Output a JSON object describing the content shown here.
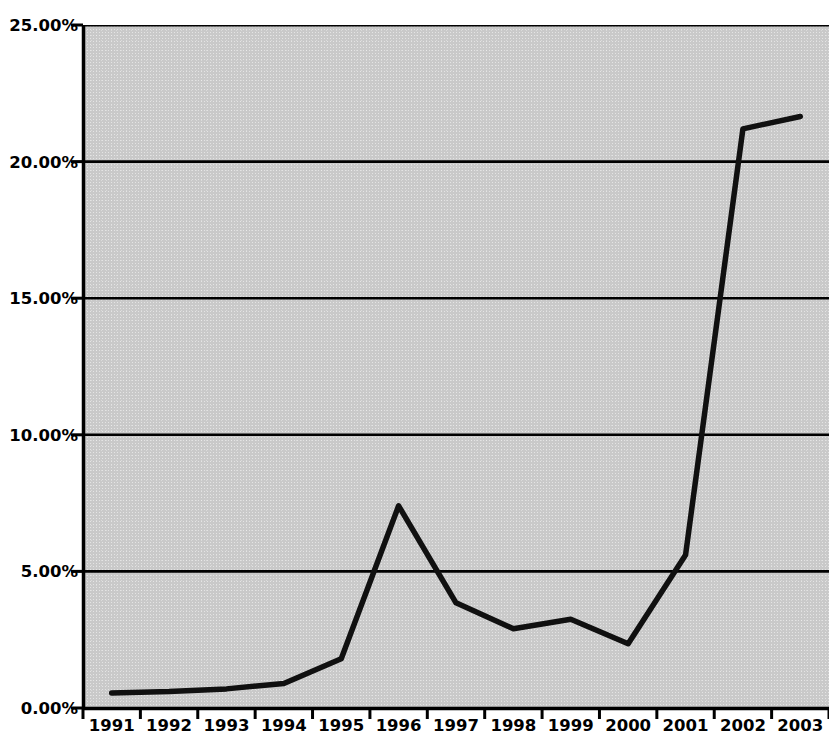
{
  "chart_data": {
    "type": "line",
    "title": "",
    "subtitle": "",
    "xlabel": "",
    "ylabel": "",
    "categories": [
      "1991",
      "1992",
      "1993",
      "1994",
      "1995",
      "1996",
      "1997",
      "1998",
      "1999",
      "2000",
      "2001",
      "2002",
      "2003"
    ],
    "values": [
      0.55,
      0.6,
      0.7,
      0.9,
      1.8,
      7.4,
      3.85,
      2.9,
      3.25,
      2.35,
      5.6,
      21.2,
      21.65
    ],
    "series": [
      {
        "name": "",
        "values": [
          0.55,
          0.6,
          0.7,
          0.9,
          1.8,
          7.4,
          3.85,
          2.9,
          3.25,
          2.35,
          5.6,
          21.2,
          21.65
        ]
      }
    ],
    "ylim": [
      0,
      25
    ],
    "y_ticks": [
      0,
      5,
      10,
      15,
      20,
      25
    ],
    "y_tick_labels": [
      "0.00%",
      "5.00%",
      "10.00%",
      "15.00%",
      "20.00%",
      "25.00%"
    ],
    "x_tick_labels": [
      "1991",
      "1992",
      "1993",
      "1994",
      "1995",
      "1996",
      "1997",
      "1998",
      "1999",
      "2000",
      "2001",
      "2002",
      "2003"
    ],
    "grid": true,
    "grid_axis": "y",
    "legend": false,
    "legend_position": "none",
    "value_format": "percent",
    "line_color": "#101010",
    "plot_background_color": "#c9c9c9",
    "axis_color": "#000000",
    "page_background_color": "#ffffff",
    "annotations": []
  },
  "axes": {
    "y_labels": [
      "25.00%",
      "20.00%",
      "15.00%",
      "10.00%",
      "5.00%",
      "0.00%"
    ],
    "x_labels": [
      "1991",
      "1992",
      "1993",
      "1994",
      "1995",
      "1996",
      "1997",
      "1998",
      "1999",
      "2000",
      "2001",
      "2002",
      "2003"
    ]
  },
  "bleed_through": {
    "line1": " ",
    "line2": " ",
    "line3": " ",
    "line4": " "
  }
}
